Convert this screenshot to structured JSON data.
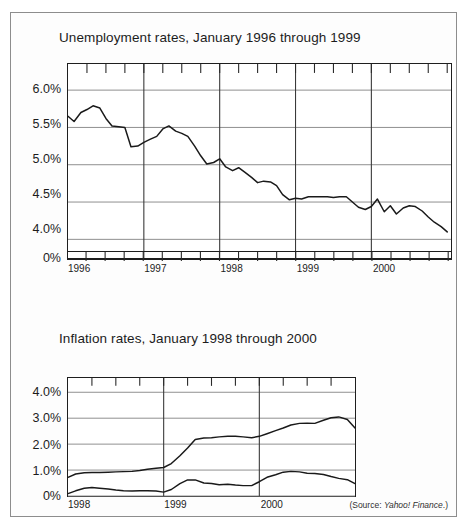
{
  "figure": {
    "source_note_prefix": "(Source: ",
    "source_note_name": "Yahoo! Finance",
    "source_note_suffix": ".)"
  },
  "chart_data": [
    {
      "type": "line",
      "id": "unemployment",
      "title": "Unemployment rates, January 1996 through 1999",
      "xlabel": "",
      "ylabel": "",
      "grid": true,
      "legend": "none",
      "y_tick_labels": [
        "6.0%",
        "5.5%",
        "5.0%",
        "4.5%",
        "4.0%",
        "0%"
      ],
      "y_tick_values": [
        6.0,
        5.5,
        5.0,
        4.5,
        4.0,
        0
      ],
      "ylim": [
        3.75,
        6.35
      ],
      "axis_break": true,
      "x_tick_labels": [
        "1996",
        "1997",
        "1998",
        "1999",
        "2000"
      ],
      "x_tick_values": [
        1996,
        1997,
        1998,
        1999,
        2000
      ],
      "xlim": [
        1996.0,
        2001.05
      ],
      "series": [
        {
          "name": "Unemployment rate",
          "x": [
            1996.0,
            1996.08,
            1996.17,
            1996.25,
            1996.33,
            1996.42,
            1996.5,
            1996.58,
            1996.67,
            1996.75,
            1996.83,
            1996.92,
            1997.0,
            1997.08,
            1997.17,
            1997.25,
            1997.33,
            1997.42,
            1997.5,
            1997.58,
            1997.67,
            1997.75,
            1997.83,
            1997.92,
            1998.0,
            1998.08,
            1998.17,
            1998.25,
            1998.33,
            1998.42,
            1998.5,
            1998.58,
            1998.67,
            1998.75,
            1998.83,
            1998.92,
            1999.0,
            1999.08,
            1999.17,
            1999.25,
            1999.33,
            1999.42,
            1999.5,
            1999.58,
            1999.67,
            1999.75,
            1999.83,
            1999.92,
            2000.0,
            2000.08,
            2000.17,
            2000.25,
            2000.33,
            2000.42,
            2000.5,
            2000.58,
            2000.67,
            2000.75,
            2000.83,
            2000.92,
            2001.0
          ],
          "values": [
            5.65,
            5.58,
            5.7,
            5.74,
            5.79,
            5.76,
            5.62,
            5.52,
            5.51,
            5.5,
            5.24,
            5.25,
            5.3,
            5.34,
            5.38,
            5.48,
            5.52,
            5.45,
            5.42,
            5.38,
            5.25,
            5.12,
            5.01,
            5.03,
            5.08,
            4.97,
            4.92,
            4.96,
            4.9,
            4.83,
            4.76,
            4.78,
            4.77,
            4.72,
            4.6,
            4.53,
            4.55,
            4.54,
            4.57,
            4.57,
            4.57,
            4.57,
            4.56,
            4.57,
            4.57,
            4.5,
            4.43,
            4.4,
            4.44,
            4.54,
            4.37,
            4.45,
            4.34,
            4.42,
            4.45,
            4.44,
            4.38,
            4.3,
            4.23,
            4.17,
            4.1
          ]
        }
      ]
    },
    {
      "type": "line",
      "id": "inflation",
      "title": "Inflation rates, January 1998 through 2000",
      "xlabel": "",
      "ylabel": "",
      "grid": true,
      "legend": "none",
      "y_tick_labels": [
        "4.0%",
        "3.0%",
        "2.0%",
        "1.0%",
        "0%"
      ],
      "y_tick_values": [
        4.0,
        3.0,
        2.0,
        1.0,
        0
      ],
      "ylim": [
        0.0,
        4.55
      ],
      "axis_break": false,
      "x_tick_labels": [
        "1998",
        "1999",
        "2000"
      ],
      "x_tick_values": [
        1998,
        1999,
        2000
      ],
      "xlim": [
        1998.0,
        2001.0
      ],
      "series": [
        {
          "name": "Headline inflation",
          "x": [
            1998.0,
            1998.08,
            1998.17,
            1998.25,
            1998.33,
            1998.42,
            1998.5,
            1998.58,
            1998.67,
            1998.75,
            1998.83,
            1998.92,
            1999.0,
            1999.08,
            1999.17,
            1999.25,
            1999.33,
            1999.42,
            1999.5,
            1999.58,
            1999.67,
            1999.75,
            1999.83,
            1999.92,
            2000.0,
            2000.08,
            2000.17,
            2000.25,
            2000.33,
            2000.42,
            2000.5,
            2000.58,
            2000.67,
            2000.75,
            2000.83,
            2000.92,
            2001.0
          ],
          "values": [
            0.72,
            0.85,
            0.9,
            0.91,
            0.91,
            0.92,
            0.93,
            0.94,
            0.95,
            0.98,
            1.03,
            1.07,
            1.1,
            1.25,
            1.55,
            1.85,
            2.18,
            2.24,
            2.25,
            2.28,
            2.3,
            2.3,
            2.28,
            2.25,
            2.3,
            2.4,
            2.52,
            2.62,
            2.74,
            2.8,
            2.81,
            2.8,
            2.92,
            3.02,
            3.05,
            2.95,
            2.62
          ]
        },
        {
          "name": "Core inflation",
          "x": [
            1998.0,
            1998.08,
            1998.17,
            1998.25,
            1998.33,
            1998.42,
            1998.5,
            1998.58,
            1998.67,
            1998.75,
            1998.83,
            1998.92,
            1999.0,
            1999.08,
            1999.17,
            1999.25,
            1999.33,
            1999.42,
            1999.5,
            1999.58,
            1999.67,
            1999.75,
            1999.83,
            1999.92,
            2000.0,
            2000.08,
            2000.17,
            2000.25,
            2000.33,
            2000.42,
            2000.5,
            2000.58,
            2000.67,
            2000.75,
            2000.83,
            2000.92,
            2001.0
          ],
          "values": [
            0.09,
            0.2,
            0.3,
            0.33,
            0.3,
            0.27,
            0.23,
            0.2,
            0.19,
            0.2,
            0.2,
            0.19,
            0.15,
            0.25,
            0.48,
            0.62,
            0.62,
            0.5,
            0.48,
            0.43,
            0.45,
            0.42,
            0.4,
            0.4,
            0.55,
            0.72,
            0.82,
            0.92,
            0.95,
            0.93,
            0.88,
            0.87,
            0.83,
            0.75,
            0.68,
            0.63,
            0.48
          ]
        }
      ]
    }
  ]
}
